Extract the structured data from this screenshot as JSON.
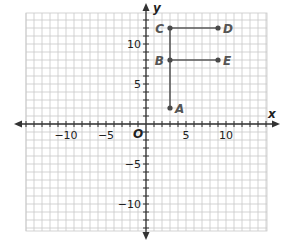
{
  "chart_data": {
    "type": "scatter",
    "title": "",
    "xlabel": "x",
    "ylabel": "y",
    "origin_label": "O",
    "xlim": [
      -15,
      15
    ],
    "ylim": [
      -13.4,
      13.9
    ],
    "grid": true,
    "grid_step": 1,
    "x_ticks": [
      {
        "value": -10,
        "label": "−10"
      },
      {
        "value": -5,
        "label": "−5"
      },
      {
        "value": 5,
        "label": "5"
      },
      {
        "value": 10,
        "label": "10"
      }
    ],
    "y_ticks": [
      {
        "value": 10,
        "label": "10"
      },
      {
        "value": 5,
        "label": "5"
      },
      {
        "value": -5,
        "label": "−5"
      },
      {
        "value": -10,
        "label": "−10"
      }
    ],
    "points": [
      {
        "name": "A",
        "x": 3,
        "y": 2
      },
      {
        "name": "B",
        "x": 3,
        "y": 8
      },
      {
        "name": "C",
        "x": 3,
        "y": 12
      },
      {
        "name": "D",
        "x": 9,
        "y": 12
      },
      {
        "name": "E",
        "x": 9,
        "y": 8
      }
    ],
    "segments": [
      {
        "from": "A",
        "to": "C"
      },
      {
        "from": "C",
        "to": "D"
      },
      {
        "from": "B",
        "to": "E"
      }
    ],
    "colors": {
      "grid": "#c8c8c8",
      "axis": "#333333",
      "segment": "#5a5a5a",
      "point": "#4a4a4a"
    }
  }
}
